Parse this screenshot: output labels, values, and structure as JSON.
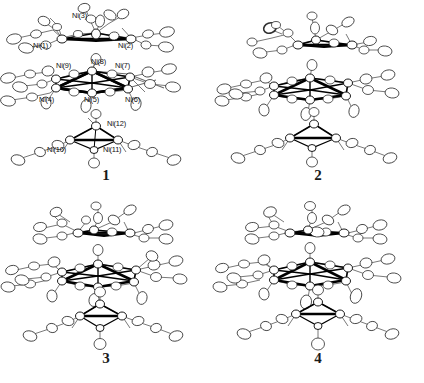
{
  "figure": {
    "background_color": "#ffffff",
    "line_color": "#1a1a1a",
    "ellipsoid_fill": "#ffffff",
    "ellipsoid_stroke": "#2a2a2a",
    "metal_bond_color": "#000000",
    "ligand_bond_color": "#5a5a5a"
  },
  "panels": [
    {
      "id": "panel-1",
      "number": "1",
      "has_labels": true,
      "labels": [
        {
          "text": "Ni(3)",
          "x": 72,
          "y": 12
        },
        {
          "text": "Ni(1)",
          "x": 33,
          "y": 42
        },
        {
          "text": "Ni(2)",
          "x": 118,
          "y": 42
        },
        {
          "text": "Ni(9)",
          "x": 56,
          "y": 62
        },
        {
          "text": "Ni(8)",
          "x": 91,
          "y": 58
        },
        {
          "text": "Ni(7)",
          "x": 115,
          "y": 62
        },
        {
          "text": "Ni(4)",
          "x": 39,
          "y": 96
        },
        {
          "text": "Ni(5)",
          "x": 84,
          "y": 96
        },
        {
          "text": "Ni(6)",
          "x": 125,
          "y": 96
        },
        {
          "text": "Ni(12)",
          "x": 107,
          "y": 120
        },
        {
          "text": "Ni(10)",
          "x": 47,
          "y": 146
        },
        {
          "text": "Ni(11)",
          "x": 103,
          "y": 146
        }
      ]
    },
    {
      "id": "panel-2",
      "number": "2",
      "has_labels": false,
      "labels": []
    },
    {
      "id": "panel-3",
      "number": "3",
      "has_labels": false,
      "labels": []
    },
    {
      "id": "panel-4",
      "number": "4",
      "has_labels": false,
      "labels": []
    }
  ]
}
